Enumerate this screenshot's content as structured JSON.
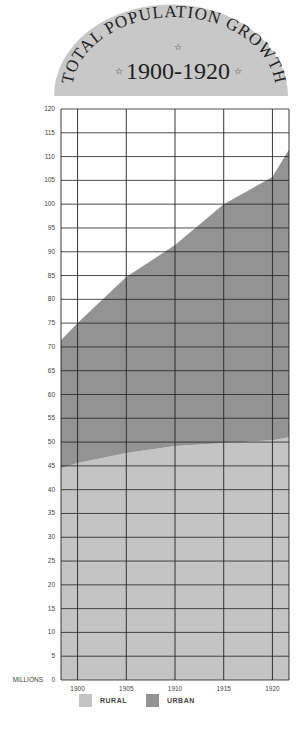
{
  "banner": {
    "title_arc": "TOTAL POPULATION GROWTH",
    "years": "1900-1920",
    "star": "☆",
    "fill": "#c8c8c8"
  },
  "chart_data": {
    "type": "area",
    "xlabel": "",
    "ylabel": "MILLIONS",
    "x": [
      1898.3,
      1900,
      1905,
      1910,
      1915,
      1920,
      1921.7
    ],
    "x_ticks": [
      "1900",
      "1905",
      "1910",
      "1915",
      "1920"
    ],
    "y_ticks": [
      0,
      5,
      10,
      15,
      20,
      25,
      30,
      35,
      40,
      45,
      50,
      55,
      60,
      65,
      70,
      75,
      80,
      85,
      90,
      95,
      100,
      105,
      110,
      115,
      120
    ],
    "ylim": [
      0,
      120
    ],
    "stacked": true,
    "grid": true,
    "series": [
      {
        "name": "RURAL",
        "color": "#c4c4c4",
        "values": [
          44.5,
          45.6,
          47.7,
          49.2,
          49.8,
          50.4,
          51.0
        ]
      },
      {
        "name": "URBAN",
        "color": "#939393",
        "cumulative_top": [
          71.4,
          75.0,
          84.7,
          91.4,
          100.0,
          105.7,
          111.5
        ],
        "values": [
          26.9,
          29.4,
          37.0,
          42.2,
          50.2,
          55.3,
          60.5
        ]
      }
    ],
    "legend": [
      "RURAL",
      "URBAN"
    ],
    "legend_position": "bottom"
  },
  "axis": {
    "y_unit_label": "MILLIONS"
  }
}
